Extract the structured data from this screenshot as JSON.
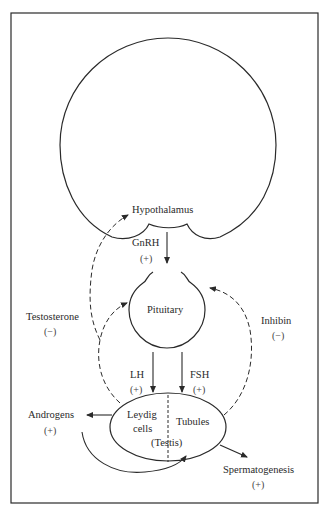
{
  "diagram": {
    "nodes": {
      "hypothalamus": {
        "label": "Hypothalamus"
      },
      "pituitary": {
        "label": "Pituitary"
      },
      "testis": {
        "label": "(Testis)",
        "compartments": {
          "leydig_line1": "Leydig",
          "leydig_line2": "cells",
          "tubules": "Tubules"
        }
      }
    },
    "edges": {
      "gnrh": {
        "label": "GnRH",
        "sign": "(+)",
        "style": "solid"
      },
      "lh": {
        "label": "LH",
        "sign": "(+)",
        "style": "solid"
      },
      "fsh": {
        "label": "FSH",
        "sign": "(+)",
        "style": "solid"
      },
      "testosterone": {
        "label": "Testosterone",
        "sign": "(−)",
        "style": "dashed"
      },
      "inhibin": {
        "label": "Inhibin",
        "sign": "(−)",
        "style": "dashed"
      },
      "androgens": {
        "label": "Androgens",
        "sign": "(+)",
        "style": "solid"
      },
      "spermatogenesis": {
        "label": "Spermatogenesis",
        "sign": "(+)",
        "style": "solid"
      }
    },
    "colors": {
      "stroke": "#2a2a2a",
      "background": "#ffffff"
    }
  }
}
